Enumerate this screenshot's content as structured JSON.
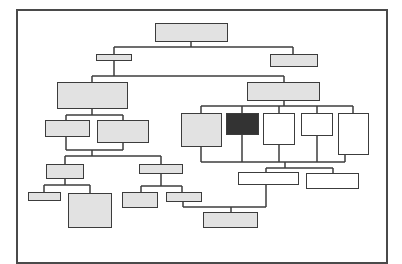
{
  "diagram": {
    "type": "organization-chart",
    "colors": {
      "line": "#3c3c3c",
      "frame": "#4a4a4a",
      "fill_gray": "#e2e2e2",
      "fill_dark": "#333333",
      "fill_white": "#ffffff"
    },
    "nodes": [
      {
        "id": "root",
        "fill": "gray",
        "x": 155,
        "y": 23,
        "w": 73,
        "h": 19
      },
      {
        "id": "l1-left",
        "fill": "gray",
        "x": 96,
        "y": 54,
        "w": 36,
        "h": 7
      },
      {
        "id": "l1-right",
        "fill": "gray",
        "x": 270,
        "y": 54,
        "w": 48,
        "h": 13
      },
      {
        "id": "l2-left",
        "fill": "gray",
        "x": 57,
        "y": 82,
        "w": 71,
        "h": 27
      },
      {
        "id": "l2-right",
        "fill": "gray",
        "x": 247,
        "y": 82,
        "w": 73,
        "h": 19
      },
      {
        "id": "l3-left-a",
        "fill": "gray",
        "x": 45,
        "y": 120,
        "w": 45,
        "h": 17
      },
      {
        "id": "l3-left-b",
        "fill": "gray",
        "x": 97,
        "y": 120,
        "w": 52,
        "h": 23
      },
      {
        "id": "l3-right-a",
        "fill": "gray",
        "x": 181,
        "y": 113,
        "w": 41,
        "h": 34
      },
      {
        "id": "l3-right-b",
        "fill": "dark",
        "x": 226,
        "y": 113,
        "w": 33,
        "h": 22
      },
      {
        "id": "l3-right-c",
        "fill": "white",
        "x": 263,
        "y": 113,
        "w": 32,
        "h": 32
      },
      {
        "id": "l3-right-d",
        "fill": "white",
        "x": 301,
        "y": 113,
        "w": 32,
        "h": 23
      },
      {
        "id": "l3-right-e",
        "fill": "white",
        "x": 338,
        "y": 113,
        "w": 31,
        "h": 42
      },
      {
        "id": "l4-left-a",
        "fill": "gray",
        "x": 46,
        "y": 164,
        "w": 38,
        "h": 15
      },
      {
        "id": "l4-left-b",
        "fill": "gray",
        "x": 139,
        "y": 164,
        "w": 44,
        "h": 10
      },
      {
        "id": "l5-left-a1",
        "fill": "gray",
        "x": 28,
        "y": 192,
        "w": 33,
        "h": 9
      },
      {
        "id": "l5-left-a2",
        "fill": "gray",
        "x": 68,
        "y": 193,
        "w": 44,
        "h": 35
      },
      {
        "id": "l5-left-b1",
        "fill": "gray",
        "x": 122,
        "y": 192,
        "w": 36,
        "h": 16
      },
      {
        "id": "l5-left-b2",
        "fill": "gray",
        "x": 166,
        "y": 192,
        "w": 36,
        "h": 10
      },
      {
        "id": "l4-right-a",
        "fill": "white",
        "x": 238,
        "y": 172,
        "w": 61,
        "h": 13
      },
      {
        "id": "l4-right-b",
        "fill": "white",
        "x": 306,
        "y": 173,
        "w": 53,
        "h": 16
      },
      {
        "id": "l5-bottom",
        "fill": "gray",
        "x": 203,
        "y": 212,
        "w": 55,
        "h": 16
      }
    ],
    "connectors": [
      {
        "x1": 191,
        "y1": 42,
        "x2": 191,
        "y2": 47
      },
      {
        "x1": 114,
        "y1": 47,
        "x2": 293,
        "y2": 47
      },
      {
        "x1": 114,
        "y1": 47,
        "x2": 114,
        "y2": 54
      },
      {
        "x1": 293,
        "y1": 47,
        "x2": 293,
        "y2": 54
      },
      {
        "x1": 114,
        "y1": 61,
        "x2": 114,
        "y2": 76
      },
      {
        "x1": 92,
        "y1": 76,
        "x2": 284,
        "y2": 76
      },
      {
        "x1": 92,
        "y1": 76,
        "x2": 92,
        "y2": 82
      },
      {
        "x1": 284,
        "y1": 76,
        "x2": 284,
        "y2": 82
      },
      {
        "x1": 92,
        "y1": 109,
        "x2": 92,
        "y2": 115
      },
      {
        "x1": 66,
        "y1": 115,
        "x2": 123,
        "y2": 115
      },
      {
        "x1": 66,
        "y1": 115,
        "x2": 66,
        "y2": 120
      },
      {
        "x1": 123,
        "y1": 115,
        "x2": 123,
        "y2": 120
      },
      {
        "x1": 66,
        "y1": 137,
        "x2": 66,
        "y2": 150
      },
      {
        "x1": 123,
        "y1": 143,
        "x2": 123,
        "y2": 150
      },
      {
        "x1": 66,
        "y1": 150,
        "x2": 123,
        "y2": 150
      },
      {
        "x1": 92,
        "y1": 150,
        "x2": 92,
        "y2": 156
      },
      {
        "x1": 65,
        "y1": 156,
        "x2": 161,
        "y2": 156
      },
      {
        "x1": 65,
        "y1": 156,
        "x2": 65,
        "y2": 164
      },
      {
        "x1": 161,
        "y1": 156,
        "x2": 161,
        "y2": 164
      },
      {
        "x1": 65,
        "y1": 179,
        "x2": 65,
        "y2": 185
      },
      {
        "x1": 44,
        "y1": 185,
        "x2": 90,
        "y2": 185
      },
      {
        "x1": 44,
        "y1": 185,
        "x2": 44,
        "y2": 192
      },
      {
        "x1": 90,
        "y1": 185,
        "x2": 90,
        "y2": 193
      },
      {
        "x1": 161,
        "y1": 174,
        "x2": 161,
        "y2": 186
      },
      {
        "x1": 141,
        "y1": 186,
        "x2": 182,
        "y2": 186
      },
      {
        "x1": 141,
        "y1": 186,
        "x2": 141,
        "y2": 192
      },
      {
        "x1": 182,
        "y1": 186,
        "x2": 182,
        "y2": 192
      },
      {
        "x1": 284,
        "y1": 101,
        "x2": 284,
        "y2": 106
      },
      {
        "x1": 201,
        "y1": 106,
        "x2": 353,
        "y2": 106
      },
      {
        "x1": 201,
        "y1": 106,
        "x2": 201,
        "y2": 113
      },
      {
        "x1": 242,
        "y1": 106,
        "x2": 242,
        "y2": 113
      },
      {
        "x1": 279,
        "y1": 106,
        "x2": 279,
        "y2": 113
      },
      {
        "x1": 317,
        "y1": 106,
        "x2": 317,
        "y2": 113
      },
      {
        "x1": 353,
        "y1": 106,
        "x2": 353,
        "y2": 113
      },
      {
        "x1": 201,
        "y1": 147,
        "x2": 201,
        "y2": 162
      },
      {
        "x1": 242,
        "y1": 135,
        "x2": 242,
        "y2": 162
      },
      {
        "x1": 279,
        "y1": 145,
        "x2": 279,
        "y2": 162
      },
      {
        "x1": 317,
        "y1": 136,
        "x2": 317,
        "y2": 162
      },
      {
        "x1": 345,
        "y1": 155,
        "x2": 345,
        "y2": 162
      },
      {
        "x1": 201,
        "y1": 162,
        "x2": 345,
        "y2": 162
      },
      {
        "x1": 285,
        "y1": 162,
        "x2": 285,
        "y2": 168
      },
      {
        "x1": 266,
        "y1": 168,
        "x2": 333,
        "y2": 168
      },
      {
        "x1": 266,
        "y1": 168,
        "x2": 266,
        "y2": 172
      },
      {
        "x1": 333,
        "y1": 168,
        "x2": 333,
        "y2": 173
      },
      {
        "x1": 266,
        "y1": 185,
        "x2": 266,
        "y2": 207
      },
      {
        "x1": 183,
        "y1": 207,
        "x2": 266,
        "y2": 207
      },
      {
        "x1": 183,
        "y1": 202,
        "x2": 183,
        "y2": 207
      },
      {
        "x1": 231,
        "y1": 207,
        "x2": 231,
        "y2": 212
      }
    ]
  }
}
